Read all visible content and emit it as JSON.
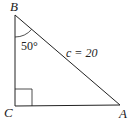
{
  "diagram": {
    "type": "right-triangle",
    "vertices": {
      "B": {
        "label": "B",
        "x": 15,
        "y": 15
      },
      "C": {
        "label": "C",
        "x": 15,
        "y": 106
      },
      "A": {
        "label": "A",
        "x": 120,
        "y": 105
      }
    },
    "right_angle_at": "C",
    "angle_B": {
      "label": "50°",
      "value": 50
    },
    "hypotenuse": {
      "label": "c = 20",
      "var": "c",
      "value": 20
    },
    "colors": {
      "stroke": "#222222",
      "background": "#ffffff"
    }
  }
}
